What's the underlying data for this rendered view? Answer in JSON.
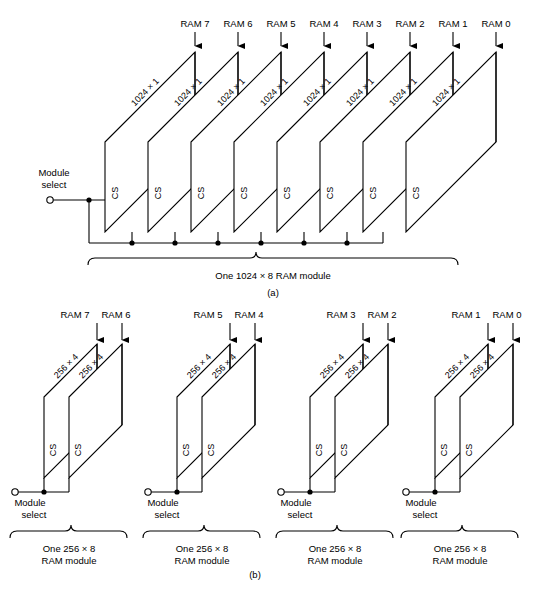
{
  "figure": {
    "parts": [
      {
        "id": "a",
        "part_label": "(a)",
        "module_select_label_line1": "Module",
        "module_select_label_line2": "select",
        "brace_caption": "One 1024 × 8 RAM module",
        "chip_label": "1024 × 1",
        "cs_label": "CS",
        "ram_labels": [
          "RAM 7",
          "RAM 6",
          "RAM 5",
          "RAM 4",
          "RAM 3",
          "RAM 2",
          "RAM 1",
          "RAM 0"
        ],
        "chip_count": 8
      },
      {
        "id": "b",
        "part_label": "(b)",
        "chip_label": "256 × 4",
        "cs_label": "CS",
        "module_select_label_line1": "Module",
        "module_select_label_line2": "select",
        "groups": [
          {
            "ram_labels": [
              "RAM 7",
              "RAM 6"
            ],
            "caption_line1": "One 256 × 8",
            "caption_line2": "RAM module"
          },
          {
            "ram_labels": [
              "RAM 5",
              "RAM 4"
            ],
            "caption_line1": "One 256 × 8",
            "caption_line2": "RAM module"
          },
          {
            "ram_labels": [
              "RAM 3",
              "RAM 2"
            ],
            "caption_line1": "One 256 × 8",
            "caption_line2": "RAM module"
          },
          {
            "ram_labels": [
              "RAM 1",
              "RAM 0"
            ],
            "caption_line1": "One 256 × 8",
            "caption_line2": "RAM module"
          }
        ]
      }
    ],
    "colors": {
      "stroke": "#000000",
      "background": "#ffffff"
    }
  }
}
